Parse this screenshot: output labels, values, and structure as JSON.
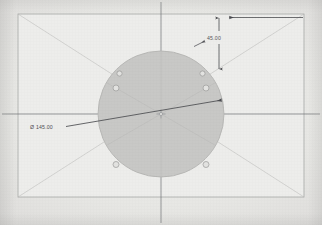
{
  "document": {
    "type": "cad-technical-drawing",
    "view": "top-view-circular-flange-plate",
    "background_color": "#e9e9e7",
    "paper_tone": "#eeeeec"
  },
  "frame": {
    "name": "drawing-border",
    "x": 18,
    "y": 14,
    "width": 286,
    "height": 183,
    "stroke_color": "#a9aaa8",
    "inner_fill": "#ededeb"
  },
  "diagonals": {
    "name": "construction-diagonals",
    "stroke_color": "#bcbcba",
    "lines": [
      {
        "x1": 18,
        "y1": 14,
        "x2": 304,
        "y2": 197
      },
      {
        "x1": 304,
        "y1": 14,
        "x2": 18,
        "y2": 197
      }
    ]
  },
  "centerlines": {
    "name": "center-lines",
    "stroke_color": "#6f7074",
    "vertical": {
      "x": 161,
      "y1": 2,
      "y2": 223
    },
    "horizontal": {
      "y": 114,
      "x1": 2,
      "x2": 320
    }
  },
  "part": {
    "name": "circular-plate",
    "center": {
      "x": 161,
      "y": 114
    },
    "radius": 63,
    "fill_color": "#c8c8c6",
    "stroke_color": "#b4b4b2",
    "label": "circular flange plate"
  },
  "radial_lines": {
    "name": "bolt-circle-spokes",
    "stroke_color": "#b9b9b7",
    "count": 6,
    "angles_deg": [
      30,
      90,
      150,
      210,
      270,
      330
    ]
  },
  "bolt_holes": {
    "name": "bolt-hole-pattern",
    "count": 6,
    "hole_radius": 3.0,
    "bolt_circle_radius": 52,
    "fill_color": "#e3e3e1",
    "stroke_color": "#9a9a98",
    "positions_deg": [
      30,
      90,
      150,
      210,
      270,
      330
    ]
  },
  "center_mark": {
    "name": "center-mark",
    "stroke_color": "#8e8f92",
    "size": 5
  },
  "dimensions": {
    "diameter": {
      "name": "diameter-dimension",
      "label": "Ø 145.00",
      "value": "145.00",
      "symbol": "Ø",
      "text_x": 30,
      "text_y": 128,
      "leader": {
        "x1": 66,
        "y1": 126,
        "x2": 222,
        "y2": 100
      },
      "arrow_at": "right",
      "stroke_color": "#4a4b4f"
    },
    "vertical_offset": {
      "name": "vertical-offset-dimension",
      "label": "45.00",
      "value": "45.00",
      "text_x": 208,
      "text_y": 38,
      "line": {
        "x": 219,
        "y1": 18,
        "y2": 69
      },
      "extension": {
        "x1": 219,
        "y1": 18,
        "x2": 304,
        "y2": 18
      },
      "stroke_color": "#4a4b4f"
    },
    "top_arrow": {
      "name": "top-horizontal-arrow",
      "line": {
        "x1": 230,
        "y1": 17,
        "x2": 303,
        "y2": 17
      },
      "arrow_at": "left",
      "stroke_color": "#4a4b4f"
    },
    "tangent_arrow": {
      "name": "tangent-leader-arrow",
      "path": "M 196 44 L 205 40",
      "stroke_color": "#55565a"
    }
  }
}
